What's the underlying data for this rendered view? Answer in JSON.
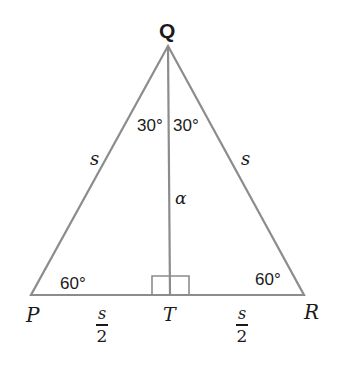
{
  "diagram": {
    "type": "equilateral-triangle-altitude",
    "colors": {
      "line": "#8c8c8c",
      "text": "#1a1a1a",
      "background": "#ffffff"
    },
    "vertices": {
      "Q": {
        "label": "Q"
      },
      "P": {
        "label": "P"
      },
      "R": {
        "label": "R"
      },
      "T": {
        "label": "T"
      }
    },
    "angles": {
      "left_top": "30°",
      "right_top": "30°",
      "bottom_left": "60°",
      "bottom_right": "60°"
    },
    "sides": {
      "left": "s",
      "right": "s",
      "altitude": "α"
    },
    "base_halves": {
      "left": {
        "numerator": "s",
        "denominator": "2"
      },
      "right": {
        "numerator": "s",
        "denominator": "2"
      }
    }
  }
}
